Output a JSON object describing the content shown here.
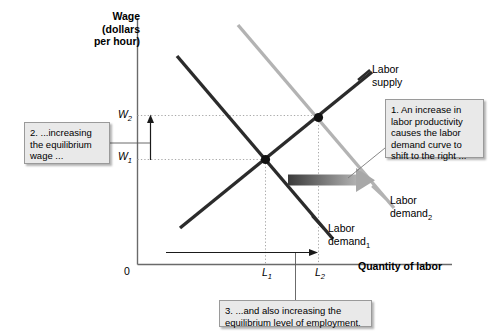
{
  "figure": {
    "type": "economics-supply-demand-diagram",
    "axes": {
      "y_title": "Wage\n(dollars\nper hour)",
      "x_title": "Quantity of labor",
      "origin_label": "0",
      "y_ticks": [
        {
          "id": "W2",
          "label": "W",
          "sub": "2",
          "pixel_y": 115
        },
        {
          "id": "W1",
          "label": "W",
          "sub": "1",
          "pixel_y": 157
        }
      ],
      "x_ticks": [
        {
          "id": "L1",
          "label": "L",
          "sub": "1",
          "pixel_x": 265
        },
        {
          "id": "L2",
          "label": "L",
          "sub": "2",
          "pixel_x": 318
        }
      ]
    },
    "curves": [
      {
        "name": "labor-supply",
        "label": "Labor\nsupply",
        "color": "#2b2b2b",
        "slope": "upward"
      },
      {
        "name": "labor-demand-1",
        "label": "Labor\ndemand",
        "sub": "1",
        "color": "#2b2b2b",
        "slope": "downward"
      },
      {
        "name": "labor-demand-2",
        "label": "Labor\ndemand",
        "sub": "2",
        "color": "#b3b3b3",
        "slope": "downward"
      }
    ],
    "equilibria": [
      {
        "name": "equilibrium-1",
        "x": 265,
        "y": 160
      },
      {
        "name": "equilibrium-2",
        "x": 318,
        "y": 118
      }
    ],
    "shift_arrow": {
      "name": "demand-shift-arrow",
      "from_color": "#3a3a3a",
      "to_color": "#a8a8a8",
      "direction": "right"
    },
    "callouts": [
      {
        "id": "callout-1",
        "text": "1. An increase in labor productivity causes the labor demand curve to shift to the right ..."
      },
      {
        "id": "callout-2",
        "text": "2. ...increasing the equilibrium wage ..."
      },
      {
        "id": "callout-3",
        "text": "3. ...and also increasing the equilibrium level of employment."
      }
    ],
    "colors": {
      "dark_curve": "#2b2b2b",
      "light_curve": "#b3b3b3",
      "axis": "#6a6a6a",
      "guide": "#a9a9a9",
      "callout_fill": "#e9e9e9",
      "callout_border": "#9a9a9a"
    }
  }
}
